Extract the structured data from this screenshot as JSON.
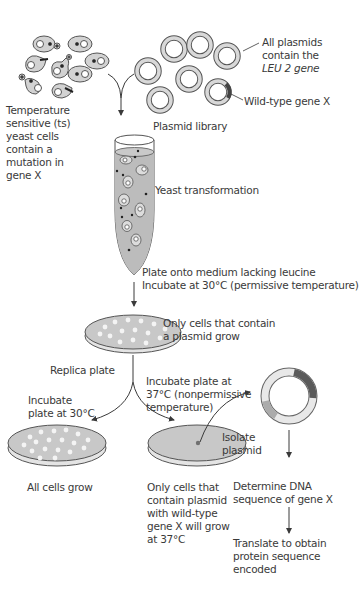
{
  "diagram": {
    "title": "",
    "colors": {
      "cell_fill": "#d2d2d2",
      "cell_stroke": "#555555",
      "plasmid_ring": "#bdbdbd",
      "plasmid_ring_light": "#e6e6e6",
      "gene_x_segment": "#5a5a5a",
      "leu2_segment": "#a8a8a8",
      "medium_fill": "#c8c8c8",
      "colony": "#f4f4f4",
      "line": "#3a3a3a",
      "text": "#3a3a3a"
    },
    "top_left": {
      "name": "ts-yeast-cells",
      "lines": [
        "Temperature",
        "sensitive (ts)",
        "yeast cells",
        "contain a",
        "mutation in",
        "gene X"
      ]
    },
    "top_right": {
      "name": "plasmid-library",
      "label": "Plasmid library",
      "annotation_leu2": [
        "All plasmids",
        "contain the",
        "LEU 2 gene"
      ],
      "annotation_genex": "Wild-type gene X"
    },
    "step_transformation": {
      "label": "Yeast transformation"
    },
    "step_plating": {
      "lines": [
        "Plate onto medium lacking leucine",
        "Incubate at 30°C (permissive temperature)"
      ]
    },
    "master_plate": {
      "lines": [
        "Only cells that contain",
        "a plasmid grow"
      ]
    },
    "replica": {
      "label": "Replica plate"
    },
    "left_branch": {
      "incubate": [
        "Incubate",
        "plate at 30°C"
      ],
      "result": "All cells grow"
    },
    "right_branch": {
      "incubate": [
        "Incubate plate at",
        "37°C (nonpermissive",
        "temperature)"
      ],
      "result": [
        "Only cells that",
        "contain plasmid",
        "with wild-type",
        "gene X will grow",
        "at 37°C"
      ],
      "isolate": [
        "Isolate",
        "plasmid"
      ]
    },
    "analysis": {
      "sequence": [
        "Determine DNA",
        "sequence of gene X"
      ],
      "translate": [
        "Translate to obtain",
        "protein sequence",
        "encoded"
      ]
    }
  }
}
